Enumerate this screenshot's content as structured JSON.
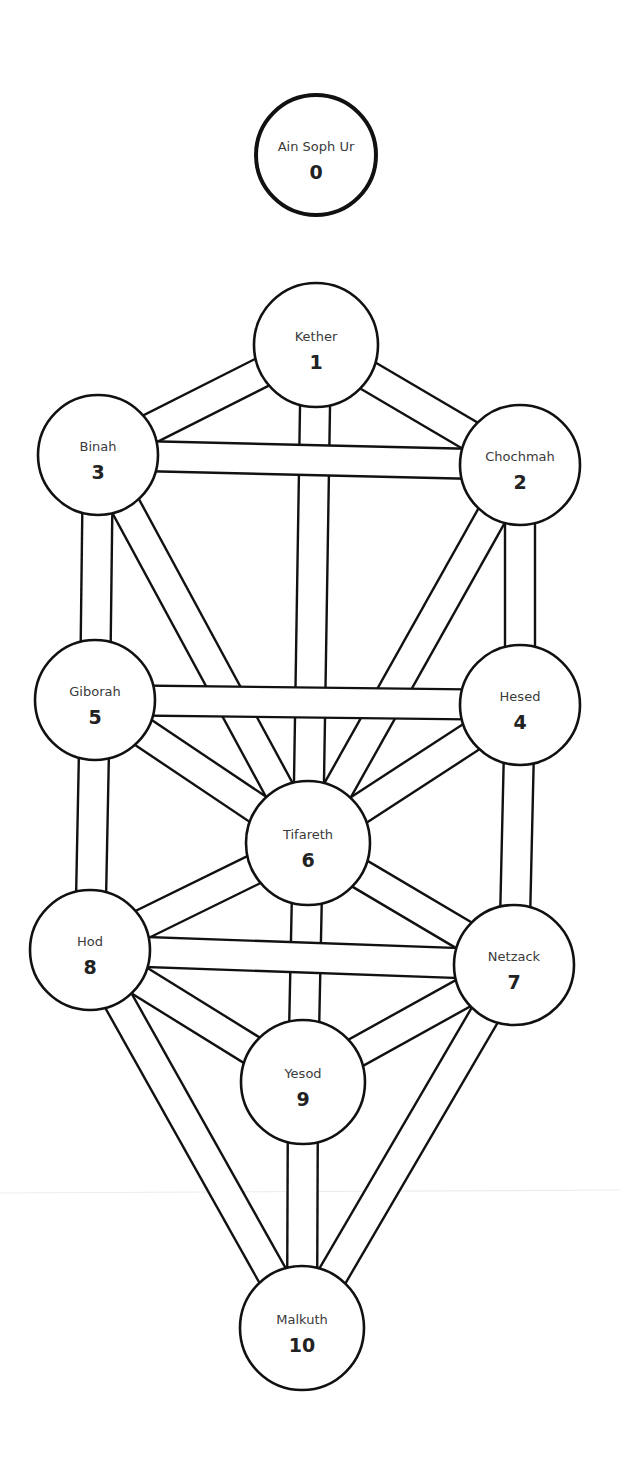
{
  "diagram": {
    "colors": {
      "stroke": "#111111",
      "background": "#ffffff",
      "text": "#3a3a3a"
    },
    "sephiroth": [
      {
        "id": 0,
        "name": "Ain Soph Ur",
        "number": "0",
        "cx": 316,
        "cy": 155,
        "r": 60
      },
      {
        "id": 1,
        "name": "Kether",
        "number": "1",
        "cx": 316,
        "cy": 345,
        "r": 62
      },
      {
        "id": 2,
        "name": "Chochmah",
        "number": "2",
        "cx": 520,
        "cy": 465,
        "r": 60
      },
      {
        "id": 3,
        "name": "Binah",
        "number": "3",
        "cx": 98,
        "cy": 455,
        "r": 60
      },
      {
        "id": 4,
        "name": "Hesed",
        "number": "4",
        "cx": 520,
        "cy": 705,
        "r": 60
      },
      {
        "id": 5,
        "name": "Giborah",
        "number": "5",
        "cx": 95,
        "cy": 700,
        "r": 60
      },
      {
        "id": 6,
        "name": "Tifareth",
        "number": "6",
        "cx": 308,
        "cy": 843,
        "r": 62
      },
      {
        "id": 7,
        "name": "Netzack",
        "number": "7",
        "cx": 514,
        "cy": 965,
        "r": 60
      },
      {
        "id": 8,
        "name": "Hod",
        "number": "8",
        "cx": 90,
        "cy": 950,
        "r": 60
      },
      {
        "id": 9,
        "name": "Yesod",
        "number": "9",
        "cx": 303,
        "cy": 1082,
        "r": 62
      },
      {
        "id": 10,
        "name": "Malkuth",
        "number": "10",
        "cx": 302,
        "cy": 1328,
        "r": 62
      }
    ],
    "paths": [
      [
        1,
        2
      ],
      [
        1,
        3
      ],
      [
        1,
        6
      ],
      [
        2,
        3
      ],
      [
        2,
        4
      ],
      [
        2,
        6
      ],
      [
        3,
        5
      ],
      [
        3,
        6
      ],
      [
        4,
        5
      ],
      [
        4,
        6
      ],
      [
        4,
        7
      ],
      [
        5,
        6
      ],
      [
        5,
        8
      ],
      [
        6,
        7
      ],
      [
        6,
        8
      ],
      [
        6,
        9
      ],
      [
        7,
        8
      ],
      [
        7,
        9
      ],
      [
        7,
        10
      ],
      [
        8,
        9
      ],
      [
        8,
        10
      ],
      [
        9,
        10
      ]
    ],
    "path_width": 30
  }
}
